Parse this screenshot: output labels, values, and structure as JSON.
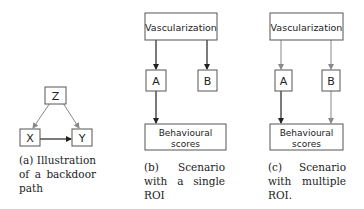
{
  "panels": [
    {
      "id": "a",
      "nodes": {
        "z": "Z",
        "x": "X",
        "y": "Y"
      },
      "caption": "(a) Illustration of a backdoor path"
    },
    {
      "id": "b",
      "nodes": {
        "top": "Vascularization",
        "a": "A",
        "b": "B",
        "bottom1": "Behavioural",
        "bottom2": "scores"
      },
      "caption": "(b) Scenario with a single ROI"
    },
    {
      "id": "c",
      "nodes": {
        "top": "Vascularization",
        "a": "A",
        "b": "B",
        "bottom1": "Behavioural",
        "bottom2": "scores"
      },
      "caption": "(c) Scenario with multiple ROI."
    }
  ],
  "colors": {
    "strong_edge": "#222222",
    "weak_edge": "#888888",
    "box_border": "#555555"
  }
}
